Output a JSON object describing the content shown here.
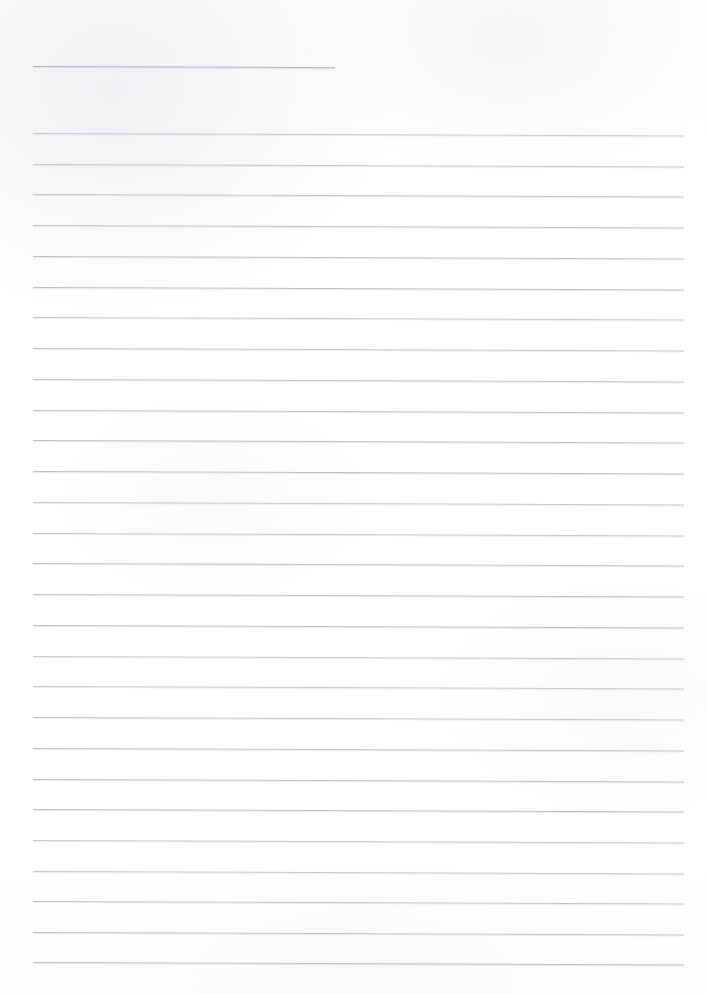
{
  "document": {
    "title": "Blank lined notebook page (scanned)",
    "kind": "ruled-paper-scan",
    "page_width": 707,
    "page_height": 994,
    "background_color": "#ffffff",
    "rule_color": "#b9bdc2",
    "header_rule_color": "#b3b7bc",
    "rule_thickness_px": 1,
    "skew_degrees": 0.22,
    "text_content": "",
    "visible_text": [],
    "margins": {
      "left_x": 33,
      "right_x": 690,
      "top_first_rule_y": 66,
      "bottom_last_rule_y": 962
    },
    "header_rule": {
      "label": "title-rule",
      "x": 33,
      "y": 66,
      "width": 302
    },
    "body_rules": {
      "count": 28,
      "first_y": 133,
      "spacing_px": 30.7,
      "x": 33,
      "width": 651,
      "y_positions": [
        133,
        164,
        194,
        225,
        256,
        287,
        317,
        348,
        379,
        410,
        440,
        471,
        502,
        533,
        563,
        594,
        625,
        656,
        686,
        717,
        748,
        779,
        809,
        840,
        871,
        901,
        932,
        962
      ]
    }
  }
}
